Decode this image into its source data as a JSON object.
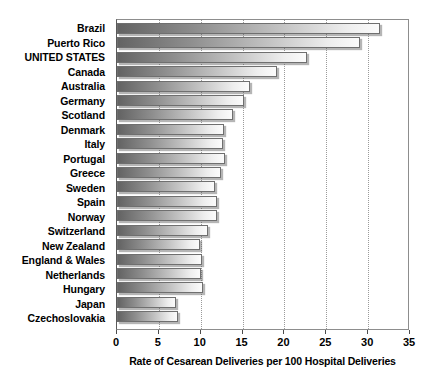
{
  "chart_data": {
    "type": "bar",
    "orientation": "horizontal",
    "title": "",
    "xlabel": "Rate of Cesarean Deliveries per 100 Hospital Deliveries",
    "ylabel": "",
    "xlim": [
      0,
      35
    ],
    "xticks": [
      0,
      5,
      10,
      15,
      20,
      25,
      30,
      35
    ],
    "grid": "vertical-dotted",
    "legend": "none",
    "bar_style": {
      "gradient_from": "#636363",
      "gradient_to": "#fbfbfb",
      "border": "#6f6f6f",
      "shadow": "#5a5a5a"
    },
    "categories": [
      "Brazil",
      "Puerto Rico",
      "UNITED STATES",
      "Canada",
      "Australia",
      "Germany",
      "Scotland",
      "Denmark",
      "Italy",
      "Portugal",
      "Greece",
      "Sweden",
      "Spain",
      "Norway",
      "Switzerland",
      "New Zealand",
      "England & Wales",
      "Netherlands",
      "Hungary",
      "Japan",
      "Czechoslovakia"
    ],
    "values": [
      31.4,
      29.0,
      22.7,
      19.1,
      15.9,
      15.2,
      13.8,
      12.8,
      12.7,
      12.9,
      12.4,
      11.7,
      12.0,
      11.9,
      10.9,
      9.9,
      10.1,
      10.0,
      10.3,
      7.0,
      7.3
    ]
  }
}
